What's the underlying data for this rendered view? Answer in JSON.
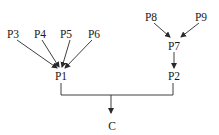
{
  "diagram": {
    "type": "tree",
    "nodes": {
      "p3": {
        "label": "P3"
      },
      "p4": {
        "label": "P4"
      },
      "p5": {
        "label": "P5"
      },
      "p6": {
        "label": "P6"
      },
      "p1": {
        "label": "P1"
      },
      "p8": {
        "label": "P8"
      },
      "p9": {
        "label": "P9"
      },
      "p7": {
        "label": "P7"
      },
      "p2": {
        "label": "P2"
      },
      "c": {
        "label": "C"
      }
    },
    "edges": [
      {
        "from": "P3",
        "to": "P1"
      },
      {
        "from": "P4",
        "to": "P1"
      },
      {
        "from": "P5",
        "to": "P1"
      },
      {
        "from": "P6",
        "to": "P1"
      },
      {
        "from": "P8",
        "to": "P7"
      },
      {
        "from": "P9",
        "to": "P7"
      },
      {
        "from": "P7",
        "to": "P2"
      },
      {
        "from": [
          "P1",
          "P2"
        ],
        "to": "C",
        "style": "bracket-join"
      }
    ],
    "colors": {
      "background": "#ffffff",
      "stroke": "#2a2a2a",
      "text": "#1a1a1a"
    }
  }
}
